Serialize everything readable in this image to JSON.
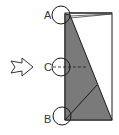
{
  "diagram": {
    "labels": {
      "a": "A",
      "b": "B",
      "c": "C"
    },
    "colors": {
      "fill": "#7a7a7a",
      "stroke": "#1a1a1a",
      "background": "#ffffff"
    },
    "icons": {
      "arrow": "hollow-right-arrow-icon"
    }
  }
}
